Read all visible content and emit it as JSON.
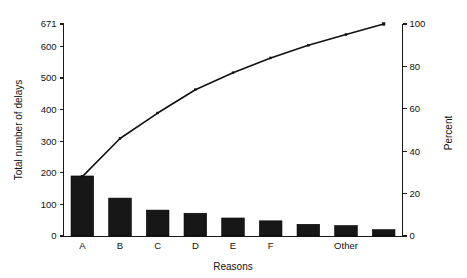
{
  "chart_data": {
    "type": "bar",
    "title": "",
    "subtitle": "",
    "xlabel": "Reasons",
    "ylabel": "Total number of delays",
    "y2label": "Percent",
    "categories": [
      "A",
      "B",
      "C",
      "D",
      "E",
      "F",
      "Other",
      "",
      ""
    ],
    "tick_labels_x": [
      "A",
      "B",
      "C",
      "D",
      "E",
      "F",
      "Other"
    ],
    "values": [
      190,
      120,
      82,
      72,
      57,
      48,
      37,
      33,
      20
    ],
    "series": [
      {
        "name": "Total number of delays",
        "type": "bar",
        "axis": "left",
        "values": [
          190,
          120,
          82,
          72,
          57,
          48,
          37,
          33,
          20
        ]
      },
      {
        "name": "Cumulative percent",
        "type": "line",
        "axis": "right",
        "values": [
          28,
          46,
          58,
          69,
          77,
          84,
          90,
          95,
          100
        ]
      }
    ],
    "ylim": [
      0,
      671
    ],
    "ylim2": [
      0,
      100
    ],
    "yticks": [
      0,
      100,
      200,
      300,
      400,
      500,
      600,
      671
    ],
    "ytick_labels": [
      "0",
      "100",
      "200",
      "300",
      "400",
      "500",
      "600",
      "671"
    ],
    "y2ticks": [
      0,
      20,
      40,
      60,
      80,
      100
    ],
    "y2tick_labels": [
      "0",
      "20",
      "40",
      "60",
      "80",
      "100"
    ],
    "grid": false,
    "legend": "none",
    "total": 671
  },
  "axes": {
    "left_title": "Total number of delays",
    "right_title": "Percent",
    "bottom_title": "Reasons"
  }
}
